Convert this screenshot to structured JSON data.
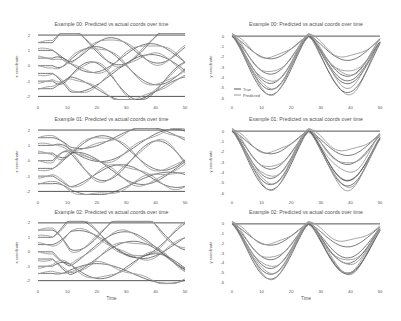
{
  "figure": {
    "width": 401,
    "height": 321,
    "background": "#ffffff"
  },
  "colors": {
    "true": "#555555",
    "predicted": "#9a9a9a",
    "axis_text": "#666666"
  },
  "legend": {
    "entries": [
      "True",
      "Predicted"
    ],
    "position": "lower left (top-right panel)"
  },
  "chart_data": [
    {
      "type": "line",
      "title": "Example 00: Predicted vs actual coords over time",
      "xlabel": "",
      "ylabel": "x coordinate",
      "xlim": [
        0,
        50
      ],
      "ylim": [
        -2.3,
        2.2
      ],
      "xticks": [
        0,
        10,
        20,
        30,
        40,
        50
      ],
      "yticks": [
        2,
        1,
        0,
        -1,
        -2
      ],
      "grid": false,
      "series_note": "Multiple joints; True (dark) and Predicted (light) curves oscillating between -2 and 2"
    },
    {
      "type": "line",
      "title": "Example 00: Predicted vs actual coords over time",
      "xlabel": "",
      "ylabel": "y coordinate",
      "xlim": [
        0,
        50
      ],
      "ylim": [
        -6.3,
        0.4
      ],
      "xticks": [
        0,
        10,
        20,
        30,
        40,
        50
      ],
      "yticks": [
        0,
        -1,
        -2,
        -3,
        -4,
        -5,
        -6
      ],
      "grid": false,
      "legend": [
        "True",
        "Predicted"
      ],
      "series_note": "Double-dip curves with minima near t=13 and t=41, maxima near t=26"
    },
    {
      "type": "line",
      "title": "Example 01: Predicted vs actual coords over time",
      "xlabel": "",
      "ylabel": "x coordinate",
      "xlim": [
        0,
        50
      ],
      "ylim": [
        -2.3,
        2.2
      ],
      "xticks": [
        0,
        10,
        20,
        30,
        40,
        50
      ],
      "yticks": [
        2,
        1,
        0,
        -1,
        -2
      ],
      "grid": false
    },
    {
      "type": "line",
      "title": "Example 01: Predicted vs actual coords over time",
      "xlabel": "",
      "ylabel": "y coordinate",
      "xlim": [
        0,
        50
      ],
      "ylim": [
        -6.3,
        0.4
      ],
      "xticks": [
        0,
        10,
        20,
        30,
        40,
        50
      ],
      "yticks": [
        0,
        -1,
        -2,
        -3,
        -4,
        -5,
        -6
      ],
      "grid": false
    },
    {
      "type": "line",
      "title": "Example 02: Predicted vs actual coords over time",
      "xlabel": "Time",
      "ylabel": "x coordinate",
      "xlim": [
        0,
        50
      ],
      "ylim": [
        -2.3,
        2.2
      ],
      "xticks": [
        0,
        10,
        20,
        30,
        40,
        50
      ],
      "yticks": [
        2,
        1,
        0,
        -1,
        -2
      ],
      "grid": false
    },
    {
      "type": "line",
      "title": "Example 02: Predicted vs actual coords over time",
      "xlabel": "Time",
      "ylabel": "y coordinate",
      "xlim": [
        0,
        50
      ],
      "ylim": [
        -6.3,
        0.4
      ],
      "xticks": [
        0,
        10,
        20,
        30,
        40,
        50
      ],
      "yticks": [
        0,
        -1,
        -2,
        -3,
        -4,
        -5,
        -6
      ],
      "grid": false
    }
  ],
  "panels": [
    {
      "id": "p00x",
      "col": 0,
      "row": 0,
      "kind": "x",
      "title": "Example 00: Predicted vs actual coords over time",
      "ylabel": "x coordinate",
      "xlabel": "",
      "legend": false,
      "seed": 3
    },
    {
      "id": "p00y",
      "col": 1,
      "row": 0,
      "kind": "y",
      "title": "Example 00: Predicted vs actual coords over time",
      "ylabel": "y coordinate",
      "xlabel": "",
      "legend": true,
      "seed": 5
    },
    {
      "id": "p01x",
      "col": 0,
      "row": 1,
      "kind": "x",
      "title": "Example 01: Predicted vs actual coords over time",
      "ylabel": "x coordinate",
      "xlabel": "",
      "legend": false,
      "seed": 7
    },
    {
      "id": "p01y",
      "col": 1,
      "row": 1,
      "kind": "y",
      "title": "Example 01: Predicted vs actual coords over time",
      "ylabel": "y coordinate",
      "xlabel": "",
      "legend": false,
      "seed": 11
    },
    {
      "id": "p02x",
      "col": 0,
      "row": 2,
      "kind": "x",
      "title": "Example 02: Predicted vs actual coords over time",
      "ylabel": "x coordinate",
      "xlabel": "Time",
      "legend": false,
      "seed": 13
    },
    {
      "id": "p02y",
      "col": 1,
      "row": 2,
      "kind": "y",
      "title": "Example 02: Predicted vs actual coords over time",
      "ylabel": "y coordinate",
      "xlabel": "Time",
      "legend": false,
      "seed": 17
    }
  ]
}
